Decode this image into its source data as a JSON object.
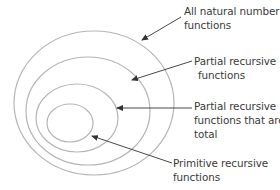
{
  "diagram": {
    "type": "nested-sets",
    "colors": {
      "ellipse_stroke": "#b5b5b5",
      "arrow": "#333333",
      "text": "#3a3a3a",
      "background": "#ffffff"
    },
    "sets": [
      {
        "id": "all-natural-number-functions",
        "label_lines": [
          "All natural number",
          "functions"
        ],
        "ellipse": {
          "cx": 94,
          "cy": 103,
          "rx": 80,
          "ry": 72
        }
      },
      {
        "id": "partial-recursive-functions",
        "label_lines": [
          "Partial recursive",
          "functions"
        ],
        "ellipse": {
          "cx": 88,
          "cy": 111,
          "rx": 62,
          "ry": 54
        }
      },
      {
        "id": "partial-recursive-total",
        "label_lines": [
          "Partial recursive",
          "functions that are",
          "total"
        ],
        "ellipse": {
          "cx": 77,
          "cy": 118,
          "rx": 41,
          "ry": 34
        }
      },
      {
        "id": "primitive-recursive-functions",
        "label_lines": [
          "Primitive recursive",
          "functions"
        ],
        "ellipse": {
          "cx": 70,
          "cy": 123,
          "rx": 23,
          "ry": 19
        }
      }
    ]
  }
}
